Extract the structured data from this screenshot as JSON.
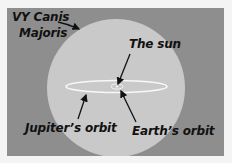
{
  "diagram": {
    "colors": {
      "background": "#f4f4f4",
      "space": "#8e8e8e",
      "star": "#c9c9c9",
      "orbit": "#f8f8f8",
      "ink": "#111111"
    },
    "labels": {
      "vy_canis_line1": "VY Canis",
      "vy_canis_line2": "Majoris",
      "sun": "The sun",
      "jupiter_orbit": "Jupiter’s orbit",
      "earth_orbit": "Earth’s orbit"
    }
  }
}
